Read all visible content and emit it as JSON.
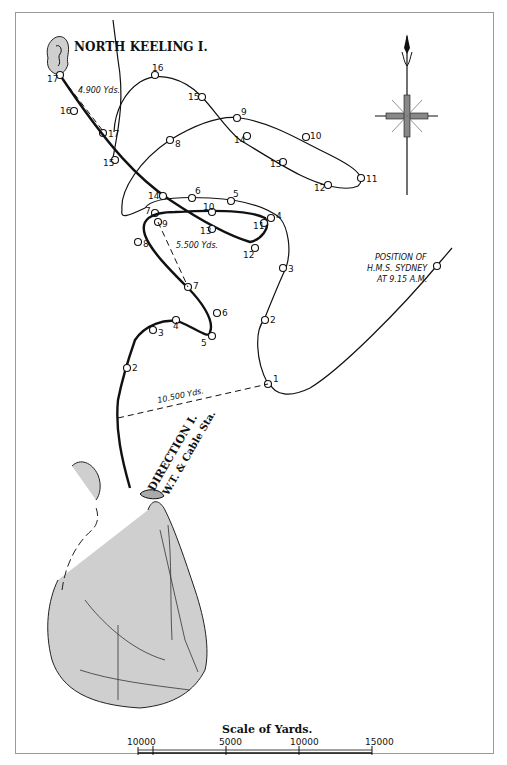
{
  "map": {
    "title_island_north": "NORTH KEELING I.",
    "title_island_south_line1": "DIRECTION I.",
    "title_island_south_line2": "W.T. & Cable Sta.",
    "sydney_label_line1": "POSITION OF",
    "sydney_label_line2": "H.M.S. SYDNEY",
    "sydney_label_line3": "AT 9.15 A.M.",
    "distances": {
      "north": "4.900 Yds.",
      "middle": "5.500 Yds.",
      "south": "10.500 Yds."
    },
    "track_thin_points": [
      "1",
      "2",
      "3",
      "4",
      "5",
      "6",
      "7",
      "8",
      "9",
      "10",
      "11",
      "12",
      "13",
      "14",
      "15",
      "16",
      "17"
    ],
    "track_thick_points": [
      "2",
      "3",
      "4",
      "5",
      "6",
      "7",
      "8",
      "9",
      "10",
      "11",
      "12",
      "13",
      "14",
      "15",
      "16",
      "17"
    ]
  },
  "labels": {
    "thin": {
      "p1": "1",
      "p2": "2",
      "p3": "3",
      "p4": "4",
      "p5": "5",
      "p6": "6",
      "p7": "7",
      "p8": "8",
      "p9": "9",
      "p10": "10",
      "p11": "11",
      "p12": "12",
      "p13": "13",
      "p14": "14",
      "p15": "15",
      "p16": "16",
      "p17": "17"
    },
    "thick": {
      "p2": "2",
      "p3": "3",
      "p4": "4",
      "p5": "5",
      "p6": "6",
      "p7": "7",
      "p8": "8",
      "p9": "9",
      "p10": "10",
      "p11": "11",
      "p12": "12",
      "p13": "13",
      "p14": "14",
      "p15": "15",
      "p16": "16",
      "p17": "17"
    }
  },
  "scale": {
    "title": "Scale of Yards.",
    "ticks": [
      "1000",
      "0",
      "5000",
      "10000",
      "15000"
    ]
  }
}
